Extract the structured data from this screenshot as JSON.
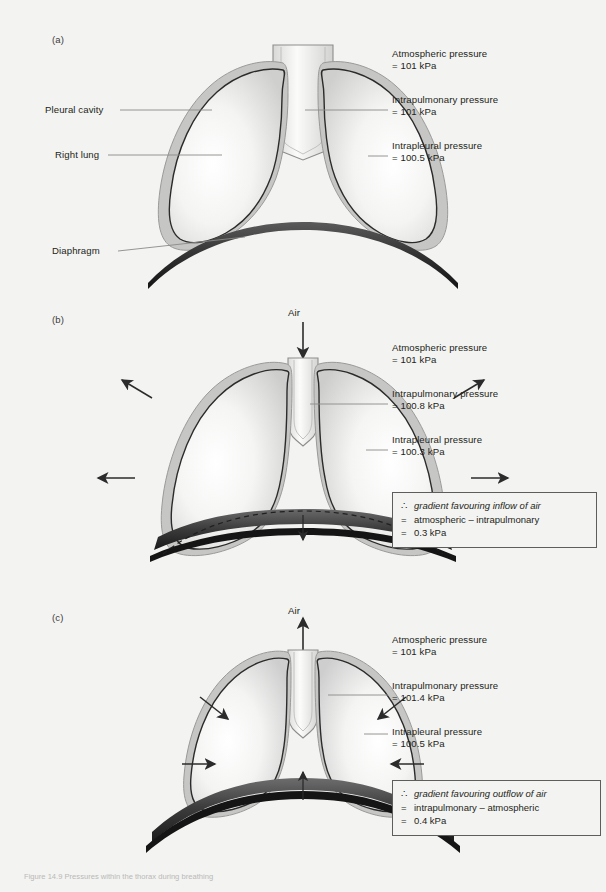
{
  "figure": {
    "background_color": "#f3f3f1",
    "caption": "Figure 14.9  Pressures within the thorax during breathing",
    "panels": [
      {
        "id": "a",
        "label": "(a)",
        "state": "at rest",
        "annotations": [
          {
            "name": "pleural-cavity",
            "text": "Pleural cavity"
          },
          {
            "name": "right-lung",
            "text": "Right lung"
          },
          {
            "name": "diaphragm",
            "text": "Diaphragm"
          }
        ],
        "readouts": [
          {
            "name": "atmospheric-pressure",
            "label": "Atmospheric pressure",
            "value": "= 101 kPa"
          },
          {
            "name": "intrapulmonary-pressure",
            "label": "Intrapulmonary pressure",
            "value": "= 101 kPa"
          },
          {
            "name": "intrapleural-pressure",
            "label": "Intrapleural pressure",
            "value": "= 100.5 kPa"
          }
        ]
      },
      {
        "id": "b",
        "label": "(b)",
        "state": "inspiration",
        "air_label": "Air",
        "readouts": [
          {
            "name": "atmospheric-pressure",
            "label": "Atmospheric pressure",
            "value": "= 101 kPa"
          },
          {
            "name": "intrapulmonary-pressure",
            "label": "Intrapulmonary pressure",
            "value": "= 100.8 kPa"
          },
          {
            "name": "intrapleural-pressure",
            "label": "Intrapleural pressure",
            "value": "= 100.3 kPa"
          }
        ],
        "conclusion": {
          "line1_symbol": "∴",
          "line1_text": "gradient favouring inflow of air",
          "line2_symbol": "=",
          "line2_text": "atmospheric – intrapulmonary",
          "line3_symbol": "=",
          "line3_text": "0.3 kPa"
        }
      },
      {
        "id": "c",
        "label": "(c)",
        "state": "expiration",
        "air_label": "Air",
        "readouts": [
          {
            "name": "atmospheric-pressure",
            "label": "Atmospheric pressure",
            "value": "= 101 kPa"
          },
          {
            "name": "intrapulmonary-pressure",
            "label": "Intrapulmonary pressure",
            "value": "= 101.4 kPa"
          },
          {
            "name": "intrapleural-pressure",
            "label": "Intrapleural pressure",
            "value": "= 100.5 kPa"
          }
        ],
        "conclusion": {
          "line1_symbol": "∴",
          "line1_text": "gradient favouring outflow of air",
          "line2_symbol": "=",
          "line2_text": "intrapulmonary – atmospheric",
          "line3_symbol": "=",
          "line3_text": "0.4 kPa"
        }
      }
    ],
    "colors": {
      "lung_outline": "#2b2b2b",
      "pleura": "#b8b8b6",
      "diaphragm_dark": "#1d1d1d",
      "diaphragm_mid": "#4a4a4a",
      "arrow": "#2b2b2b",
      "leader_line": "#8a8a88"
    }
  }
}
